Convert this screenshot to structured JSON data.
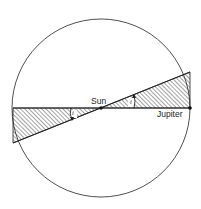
{
  "diagram": {
    "title": "",
    "labels": {
      "sun": "Sun",
      "jupiter": "Jupiter",
      "inclination_left": "i",
      "inclination_right": "i"
    },
    "colors": {
      "stroke": "#222222",
      "hatch": "#333333",
      "background": "#ffffff"
    },
    "geometry": {
      "circle": {
        "cx": 101,
        "cy": 108,
        "r": 89
      },
      "horizontal_line": {
        "x1": 13,
        "y1": 108,
        "x2": 190,
        "y2": 108
      },
      "tilted_line": {
        "x1": 13,
        "y1": 143,
        "x2": 190,
        "y2": 72
      },
      "sun_point": {
        "x": 101,
        "y": 108
      },
      "jupiter_point": {
        "x": 190,
        "y": 108
      }
    },
    "elements": [
      "circular orbit",
      "reference plane (horizontal line)",
      "inclined orbital plane (tilted line)",
      "hatched wedge regions between planes",
      "inclination angle arcs labeled i"
    ]
  }
}
